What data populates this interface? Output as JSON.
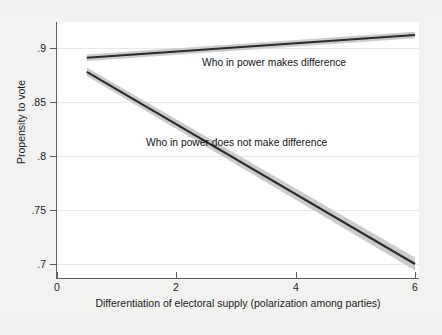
{
  "figure": {
    "background_color": "#f2f2f1",
    "panel_color": "#ffffff",
    "axis_color": "#5d5d5d"
  },
  "chart_data": {
    "type": "line",
    "title": "",
    "subtitle": "",
    "xlabel": "Differentiation of electoral supply (polarization among parties)",
    "ylabel": "Propensity to vote",
    "xlim": [
      0,
      6
    ],
    "ylim": [
      0.7,
      0.9
    ],
    "xticks": [
      0,
      2,
      4,
      6
    ],
    "xtick_labels": [
      "0",
      "2",
      "4",
      "6"
    ],
    "yticks": [
      0.7,
      0.75,
      0.8,
      0.85,
      0.9
    ],
    "ytick_labels": [
      ".7",
      ".75",
      ".8",
      ".85",
      ".9"
    ],
    "grid": "horizontal",
    "legend": "inline annotations",
    "legend_position": "inside-plot",
    "line_color": "#2b2b2b",
    "band_color": "#c9c9c9",
    "series": [
      {
        "name": "Who in power makes difference",
        "x": [
          0.5,
          6.0
        ],
        "values": [
          0.891,
          0.912
        ],
        "ci_lower": [
          0.888,
          0.909
        ],
        "ci_upper": [
          0.894,
          0.915
        ],
        "annotation": "Who in power makes difference"
      },
      {
        "name": "Who in power does not make difference",
        "x": [
          0.5,
          6.0
        ],
        "values": [
          0.878,
          0.7
        ],
        "ci_lower": [
          0.874,
          0.694
        ],
        "ci_upper": [
          0.882,
          0.706
        ],
        "annotation": "Who in power does not make difference"
      }
    ],
    "annotations": [
      {
        "text": "Who in power makes difference",
        "x": 3.3,
        "y": 0.8755
      },
      {
        "text": "Who in power does not make difference",
        "x": 2.45,
        "y": 0.8015
      }
    ]
  }
}
